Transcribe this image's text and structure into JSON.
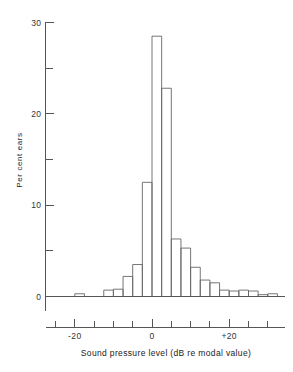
{
  "chart_data": {
    "type": "bar",
    "title": "",
    "subtitle": "",
    "xlabel": "Sound pressure level (dB re modal value)",
    "ylabel": "Per cent ears",
    "xlim": [
      -28.75,
      33.75
    ],
    "ylim": [
      0,
      30
    ],
    "grid": false,
    "legend": null,
    "bin_width": 2.5,
    "x_ticks": [
      -20,
      0,
      20
    ],
    "x_tick_labels": [
      "-20",
      "0",
      "+20"
    ],
    "x_minor_ticks": [
      -25,
      -15,
      -10,
      -5,
      5,
      10,
      15,
      25,
      30
    ],
    "y_ticks": [
      0,
      10,
      20,
      30
    ],
    "y_tick_labels": [
      "0",
      "10",
      "20",
      "30"
    ],
    "y_minor_ticks": [
      5,
      15,
      25
    ],
    "categories": [
      "-28.75",
      "-26.25",
      "-23.75",
      "-21.25",
      "-18.75",
      "-16.25",
      "-13.75",
      "-11.25",
      "-8.75",
      "-6.25",
      "-3.75",
      "-1.25",
      "1.25",
      "3.75",
      "6.25",
      "8.75",
      "11.25",
      "13.75",
      "16.25",
      "18.75",
      "21.25",
      "23.75",
      "26.25",
      "28.75",
      "31.25"
    ],
    "bin_centers": [
      -28.75,
      -26.25,
      -23.75,
      -21.25,
      -18.75,
      -16.25,
      -13.75,
      -11.25,
      -8.75,
      -6.25,
      -3.75,
      -1.25,
      1.25,
      3.75,
      6.25,
      8.75,
      11.25,
      13.75,
      16.25,
      18.75,
      21.25,
      23.75,
      26.25,
      28.75,
      31.25
    ],
    "values": [
      0,
      0,
      0,
      0,
      0.3,
      0,
      0,
      0.7,
      0.8,
      2.2,
      3.5,
      12.5,
      28.5,
      22.8,
      6.3,
      5.3,
      3.2,
      1.8,
      1.5,
      0.7,
      0.6,
      0.7,
      0.6,
      0.2,
      0.3
    ],
    "peak_value": 28.5,
    "peak_bin": 1.25
  },
  "labels": {
    "y_axis_title": "Per cent ears",
    "x_axis_title": "Sound pressure level (dB re modal value)"
  },
  "colors": {
    "background": "#ffffff",
    "axis": "#555555",
    "bar_stroke": "#666666",
    "text": "#222222"
  }
}
